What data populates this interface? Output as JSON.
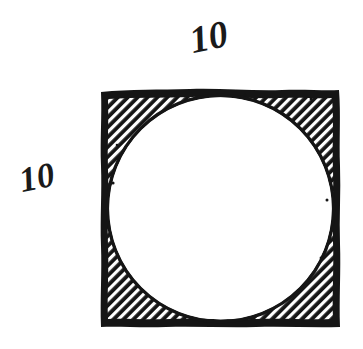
{
  "figure": {
    "background_color": "#ffffff",
    "ink_color": "#151515",
    "labels": {
      "top": "10",
      "left": "10"
    },
    "square": {
      "side_label": "10",
      "x": 101,
      "y": 90,
      "width": 239,
      "height": 237,
      "stroke_width": 7
    },
    "circle": {
      "cx": 220.5,
      "cy": 208.5,
      "r": 113,
      "fill": "#ffffff"
    },
    "hatching": {
      "angle_degrees": 45,
      "line_color": "#ffffff",
      "line_width": 3.2,
      "spacing": 7,
      "region": "between-square-and-circle",
      "fill_color": "#151515"
    }
  }
}
